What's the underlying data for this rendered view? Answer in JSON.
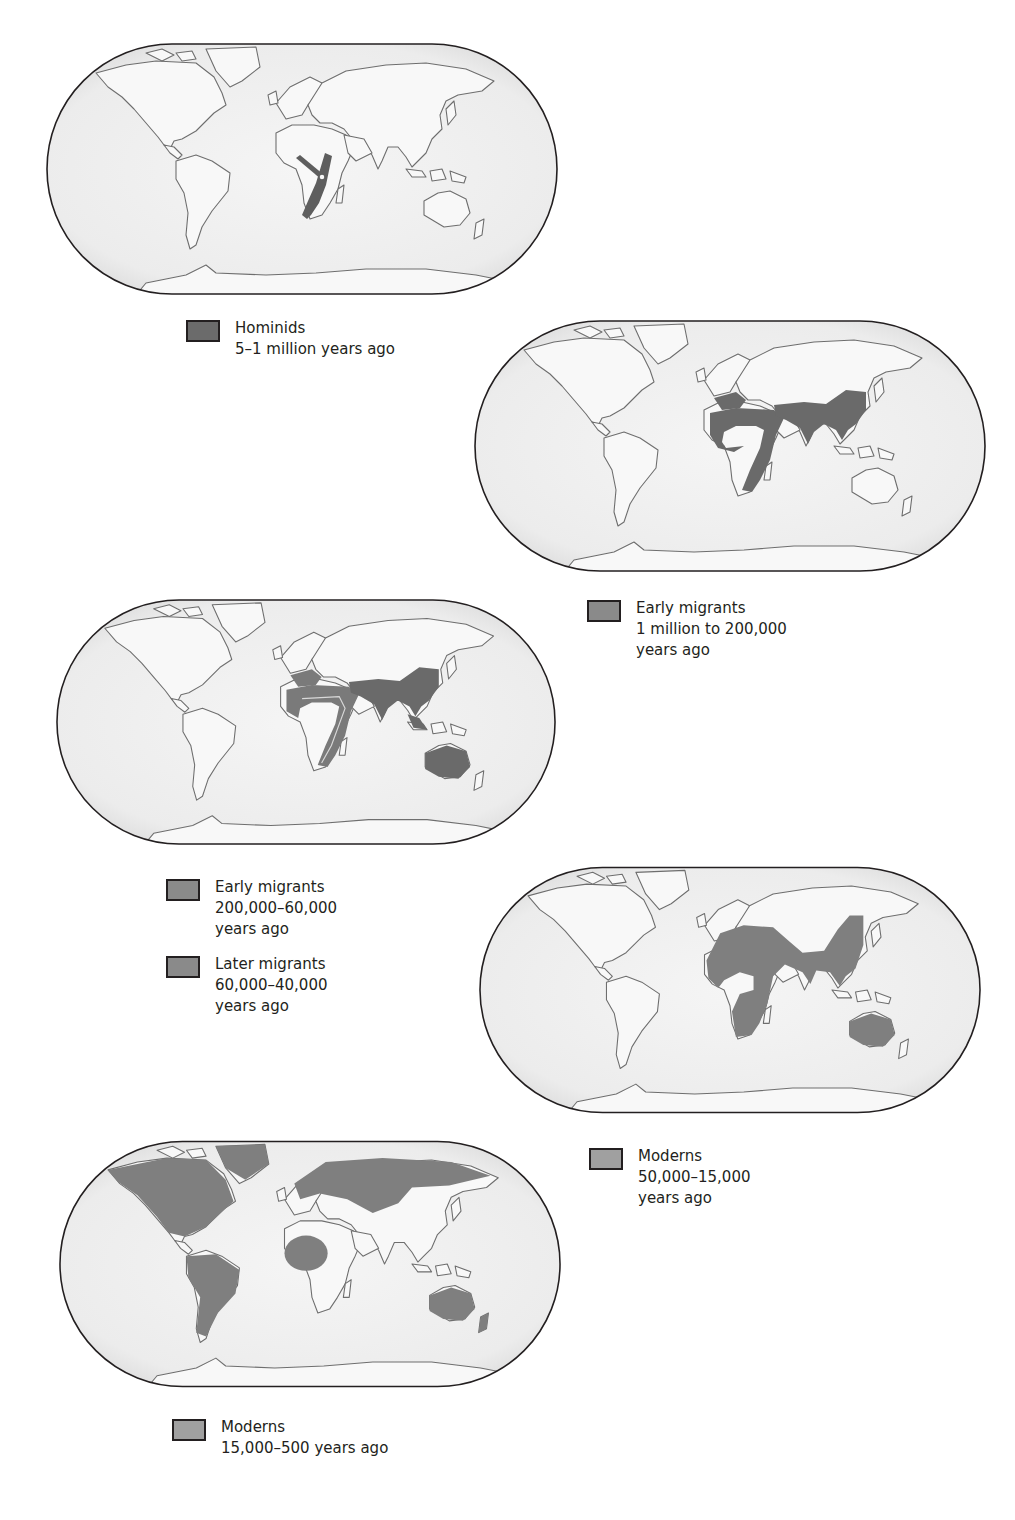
{
  "colors": {
    "ocean": "#f3f3f3",
    "land": "#f7f7f7",
    "coastline": "#6e6e6e",
    "frame": "#231f20",
    "hominids": "#5e5e5e",
    "early_migrants_1": "#6a6a6a",
    "early_migrants_2": "#7a7a7a",
    "later_migrants": "#6a6a6a",
    "moderns_1": "#7f7f7f",
    "moderns_2": "#7f7f7f"
  },
  "panels": [
    {
      "id": "hominids",
      "legend": [
        {
          "title": "Hominids",
          "lines": [
            "5–1 million years ago"
          ]
        }
      ]
    },
    {
      "id": "early-migrants-1",
      "legend": [
        {
          "title": "Early migrants",
          "lines": [
            "1 million to 200,000",
            "years ago"
          ]
        }
      ]
    },
    {
      "id": "early-later-migrants",
      "legend": [
        {
          "title": "Early migrants",
          "lines": [
            "200,000–60,000",
            "years ago"
          ]
        },
        {
          "title": "Later migrants",
          "lines": [
            "60,000–40,000",
            "years ago"
          ]
        }
      ]
    },
    {
      "id": "moderns-1",
      "legend": [
        {
          "title": "Moderns",
          "lines": [
            "50,000–15,000",
            "years ago"
          ]
        }
      ]
    },
    {
      "id": "moderns-2",
      "legend": [
        {
          "title": "Moderns",
          "lines": [
            "15,000–500 years ago"
          ]
        }
      ]
    }
  ]
}
